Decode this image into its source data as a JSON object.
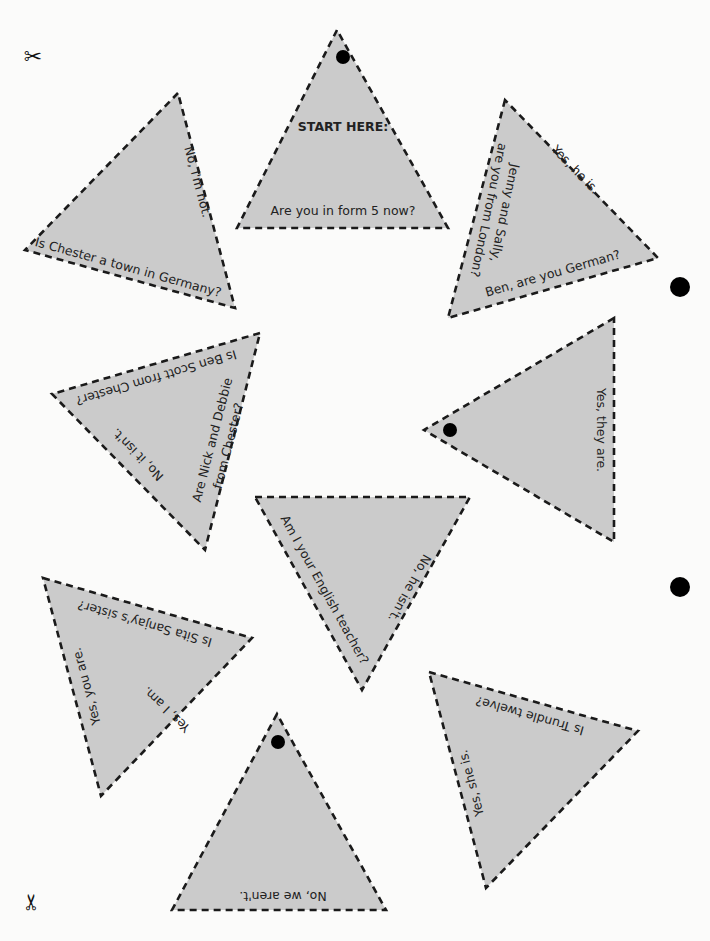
{
  "page": {
    "background": "#fbfbfa",
    "triangle_fill": "#cbcbcb",
    "border_color": "#1a1a1a"
  },
  "icons": {
    "scissors_top": "✂",
    "scissors_bottom": "✂"
  },
  "cards": [
    {
      "id": "start",
      "has_dot": true,
      "texts": [
        "START HERE:",
        "Are you in form 5 now?"
      ]
    },
    {
      "id": "chester-town",
      "has_dot": false,
      "texts": [
        "No, I'm not.",
        "Is Chester a town in Germany?"
      ]
    },
    {
      "id": "jenny-sally",
      "has_dot": false,
      "texts": [
        "Yes, he is.",
        "Jenny and Sally,",
        "are you from London?",
        "Ben, are you German?"
      ]
    },
    {
      "id": "ben-scott",
      "has_dot": false,
      "texts": [
        "Is Ben Scott from Chester?",
        "Are Nick and Debbie",
        "from Chester?",
        "No, it isn't."
      ]
    },
    {
      "id": "yes-they-are",
      "has_dot": true,
      "texts": [
        "Yes, they are."
      ]
    },
    {
      "id": "english-teacher",
      "has_dot": false,
      "texts": [
        "Am I your English teacher?",
        "No, he isn't."
      ]
    },
    {
      "id": "sita",
      "has_dot": false,
      "texts": [
        "Is Sita Sanjay's sister?",
        "Yes, you are.",
        "Yes, I am."
      ]
    },
    {
      "id": "trundle",
      "has_dot": false,
      "texts": [
        "Is Trundle twelve?",
        "Yes, she is."
      ]
    },
    {
      "id": "we-arent",
      "has_dot": true,
      "texts": [
        "No, we aren't."
      ]
    }
  ],
  "punch_holes": [
    {
      "x": 680,
      "y": 287
    },
    {
      "x": 680,
      "y": 587
    }
  ]
}
